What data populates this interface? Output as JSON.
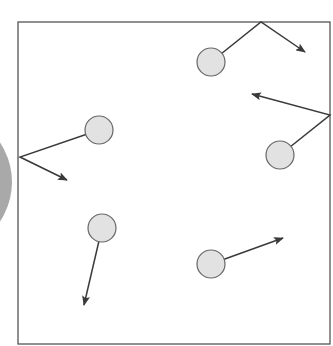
{
  "diagram": {
    "title": "",
    "colors": {
      "background": "#ffffff",
      "box_stroke": "#555555",
      "particle_fill": "#e2e2e2",
      "particle_stroke": "#666666",
      "path_stroke": "#3a3a3a",
      "side_disc": "#a9a9a9"
    },
    "container": {
      "x": 18,
      "y": 22,
      "width": 312,
      "height": 322
    },
    "side_disc": {
      "cx": -90,
      "cy": 182,
      "rx": 102,
      "ry": 84
    },
    "particles": [
      {
        "id": "p1",
        "cx": 99,
        "cy": 130,
        "r": 14,
        "path": [
          [
            99,
            130
          ],
          [
            20,
            157
          ],
          [
            67,
            180
          ]
        ]
      },
      {
        "id": "p2",
        "cx": 211,
        "cy": 62,
        "r": 14,
        "path": [
          [
            211,
            62
          ],
          [
            261,
            22
          ],
          [
            305,
            52
          ]
        ]
      },
      {
        "id": "p3",
        "cx": 280,
        "cy": 155,
        "r": 14,
        "path": [
          [
            280,
            155
          ],
          [
            330,
            115
          ],
          [
            252,
            94
          ]
        ]
      },
      {
        "id": "p4",
        "cx": 102,
        "cy": 228,
        "r": 14,
        "path": [
          [
            102,
            228
          ],
          [
            84,
            305
          ]
        ]
      },
      {
        "id": "p5",
        "cx": 211,
        "cy": 264,
        "r": 14,
        "path": [
          [
            211,
            264
          ],
          [
            283,
            238
          ]
        ]
      }
    ]
  }
}
